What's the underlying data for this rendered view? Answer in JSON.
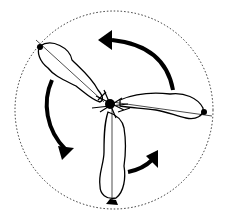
{
  "figure": {
    "stroke_color": "#000000",
    "background_color": "#ffffff",
    "circle": {
      "cx": 114,
      "cy": 110,
      "r": 99,
      "style": "dotted"
    },
    "feathers": [
      {
        "name": "upper-left",
        "tip": [
          40,
          46
        ]
      },
      {
        "name": "right",
        "tip": [
          205,
          112
        ]
      },
      {
        "name": "bottom",
        "tip": [
          110,
          204
        ]
      }
    ],
    "arrows": [
      {
        "name": "top",
        "direction": "counterclockwise"
      },
      {
        "name": "left",
        "direction": "counterclockwise"
      },
      {
        "name": "bottom-right",
        "direction": "counterclockwise"
      }
    ]
  }
}
